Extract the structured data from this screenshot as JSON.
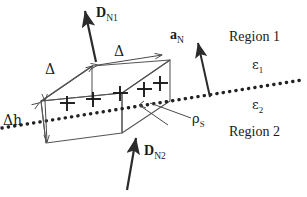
{
  "figure": {
    "background_color": "#ffffff",
    "line_color": "#4a4a4a",
    "arrow_color": "#2b2b2b",
    "text_color": "#1a1a1a",
    "width": 307,
    "height": 197
  },
  "labels": {
    "d_n1": {
      "vector": "D",
      "subscript": "N1"
    },
    "d_n2": {
      "vector": "D",
      "subscript": "N2"
    },
    "a_n": {
      "vector": "a",
      "subscript": "N"
    },
    "delta_top": "Δ",
    "delta_left": "Δ",
    "delta_h": "Δh",
    "rho_s": {
      "symbol": "ρ",
      "subscript": "S"
    },
    "region1": "Region 1",
    "region2": "Region 2",
    "eps1": {
      "symbol": "ε",
      "subscript": "1"
    },
    "eps2": {
      "symbol": "ε",
      "subscript": "2"
    }
  },
  "charges": {
    "symbol": "+",
    "count": 5,
    "positions": [
      {
        "x": 67,
        "y": 103
      },
      {
        "x": 93,
        "y": 99
      },
      {
        "x": 120,
        "y": 93
      },
      {
        "x": 144,
        "y": 89
      },
      {
        "x": 160,
        "y": 83
      }
    ]
  },
  "interface": {
    "style": "dotted",
    "from": {
      "x": 2,
      "y": 128
    },
    "to": {
      "x": 302,
      "y": 80
    }
  }
}
